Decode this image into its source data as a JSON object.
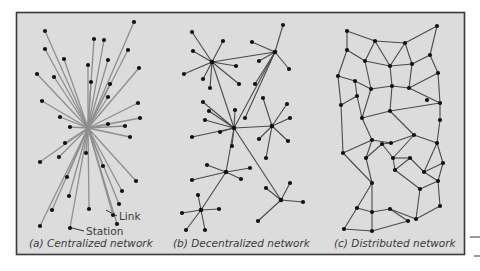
{
  "diagram": {
    "colors": {
      "background": "#ffffff",
      "panel": "#dcdcdc",
      "border": "#3a3a3a",
      "centralized_link": "#8e8e8e",
      "link": "#4a4a4a",
      "node": "#111111",
      "text": "#3a3a3a"
    },
    "panels": [
      {
        "id": "a",
        "caption": "(a) Centralized network",
        "type": "centralized",
        "annotations": [
          {
            "label": "Link",
            "x": 119,
            "y": 219
          },
          {
            "label": "Station",
            "x": 86,
            "y": 234
          }
        ]
      },
      {
        "id": "b",
        "caption": "(b) Decentralized network",
        "type": "decentralized"
      },
      {
        "id": "c",
        "caption": "(c) Distributed network",
        "type": "distributed"
      }
    ],
    "centralized": {
      "hub": [
        88,
        128
      ],
      "nodes": [
        [
          45,
          31
        ],
        [
          94,
          39
        ],
        [
          104,
          40
        ],
        [
          134,
          22
        ],
        [
          45,
          49
        ],
        [
          64,
          59
        ],
        [
          108,
          60
        ],
        [
          128,
          50
        ],
        [
          37,
          74
        ],
        [
          54,
          77
        ],
        [
          88,
          65
        ],
        [
          91,
          82
        ],
        [
          110,
          84
        ],
        [
          139,
          68
        ],
        [
          42,
          101
        ],
        [
          60,
          117
        ],
        [
          70,
          127
        ],
        [
          108,
          97
        ],
        [
          138,
          103
        ],
        [
          140,
          118
        ],
        [
          108,
          124
        ],
        [
          125,
          126
        ],
        [
          65,
          143
        ],
        [
          130,
          137
        ],
        [
          40,
          162
        ],
        [
          59,
          157
        ],
        [
          86,
          153
        ],
        [
          103,
          166
        ],
        [
          136,
          181
        ],
        [
          67,
          177
        ],
        [
          122,
          191
        ],
        [
          69,
          196
        ],
        [
          89,
          209
        ],
        [
          113,
          215
        ],
        [
          119,
          204
        ],
        [
          40,
          226
        ],
        [
          52,
          210
        ],
        [
          70,
          228
        ],
        [
          117,
          224
        ]
      ]
    },
    "decentralized": {
      "hubs": [
        [
          212,
          62
        ],
        [
          275,
          52
        ],
        [
          234,
          128
        ],
        [
          272,
          126
        ],
        [
          226,
          172
        ],
        [
          201,
          210
        ],
        [
          281,
          200
        ]
      ],
      "hub_links": [
        [
          0,
          1
        ],
        [
          0,
          2
        ],
        [
          1,
          2
        ],
        [
          2,
          3
        ],
        [
          2,
          4
        ],
        [
          2,
          6
        ],
        [
          4,
          5
        ]
      ],
      "spokes": [
        [
          0,
          [
            192,
            32
          ],
          [
            223,
            41
          ],
          [
            193,
            51
          ],
          [
            236,
            66
          ],
          [
            184,
            74
          ],
          [
            203,
            79
          ],
          [
            210,
            88
          ],
          [
            239,
            84
          ]
        ],
        [
          1,
          [
            283,
            25
          ],
          [
            252,
            42
          ],
          [
            259,
            61
          ],
          [
            289,
            69
          ],
          [
            255,
            84
          ],
          [
            245,
            118
          ]
        ],
        [
          2,
          [
            209,
            111
          ],
          [
            203,
            102
          ],
          [
            205,
            120
          ],
          [
            220,
            132
          ],
          [
            232,
            146
          ],
          [
            192,
            137
          ],
          [
            235,
            110
          ]
        ],
        [
          3,
          [
            263,
            98
          ],
          [
            287,
            104
          ],
          [
            290,
            118
          ],
          [
            259,
            139
          ],
          [
            288,
            141
          ],
          [
            266,
            158
          ]
        ],
        [
          4,
          [
            207,
            165
          ],
          [
            250,
            168
          ],
          [
            192,
            180
          ],
          [
            241,
            179
          ]
        ],
        [
          5,
          [
            186,
            230
          ],
          [
            198,
            195
          ],
          [
            219,
            209
          ],
          [
            182,
            213
          ],
          [
            205,
            230
          ]
        ],
        [
          6,
          [
            290,
            183
          ],
          [
            266,
            188
          ],
          [
            258,
            221
          ],
          [
            303,
            202
          ]
        ]
      ]
    },
    "distributed": {
      "nodes": [
        [
          347,
          31
        ],
        [
          375,
          41
        ],
        [
          405,
          43
        ],
        [
          437,
          26
        ],
        [
          347,
          50
        ],
        [
          365,
          61
        ],
        [
          390,
          66
        ],
        [
          412,
          64
        ],
        [
          430,
          55
        ],
        [
          438,
          73
        ],
        [
          338,
          76
        ],
        [
          355,
          81
        ],
        [
          371,
          89
        ],
        [
          392,
          86
        ],
        [
          409,
          88
        ],
        [
          427,
          100
        ],
        [
          357,
          96
        ],
        [
          341,
          105
        ],
        [
          362,
          118
        ],
        [
          390,
          111
        ],
        [
          440,
          103
        ],
        [
          440,
          120
        ],
        [
          372,
          140
        ],
        [
          391,
          143
        ],
        [
          414,
          135
        ],
        [
          437,
          143
        ],
        [
          343,
          153
        ],
        [
          366,
          158
        ],
        [
          382,
          144
        ],
        [
          393,
          158
        ],
        [
          395,
          170
        ],
        [
          410,
          158
        ],
        [
          424,
          172
        ],
        [
          443,
          163
        ],
        [
          372,
          183
        ],
        [
          420,
          189
        ],
        [
          438,
          181
        ],
        [
          357,
          208
        ],
        [
          372,
          212
        ],
        [
          390,
          209
        ],
        [
          416,
          219
        ],
        [
          440,
          206
        ],
        [
          344,
          229
        ],
        [
          372,
          231
        ],
        [
          408,
          221
        ]
      ],
      "edges": [
        [
          0,
          1
        ],
        [
          1,
          2
        ],
        [
          2,
          3
        ],
        [
          0,
          4
        ],
        [
          3,
          8
        ],
        [
          1,
          5
        ],
        [
          1,
          6
        ],
        [
          2,
          6
        ],
        [
          2,
          7
        ],
        [
          4,
          5
        ],
        [
          4,
          10
        ],
        [
          5,
          6
        ],
        [
          5,
          12
        ],
        [
          6,
          7
        ],
        [
          6,
          13
        ],
        [
          7,
          8
        ],
        [
          7,
          14
        ],
        [
          8,
          9
        ],
        [
          10,
          11
        ],
        [
          10,
          17
        ],
        [
          11,
          12
        ],
        [
          11,
          16
        ],
        [
          12,
          13
        ],
        [
          12,
          18
        ],
        [
          13,
          14
        ],
        [
          13,
          19
        ],
        [
          14,
          9
        ],
        [
          14,
          20
        ],
        [
          9,
          20
        ],
        [
          16,
          17
        ],
        [
          16,
          18
        ],
        [
          17,
          26
        ],
        [
          18,
          19
        ],
        [
          18,
          22
        ],
        [
          19,
          20
        ],
        [
          19,
          24
        ],
        [
          20,
          21
        ],
        [
          21,
          25
        ],
        [
          22,
          23
        ],
        [
          22,
          26
        ],
        [
          22,
          27
        ],
        [
          23,
          28
        ],
        [
          23,
          24
        ],
        [
          24,
          25
        ],
        [
          24,
          29
        ],
        [
          25,
          32
        ],
        [
          25,
          33
        ],
        [
          26,
          34
        ],
        [
          27,
          28
        ],
        [
          27,
          34
        ],
        [
          28,
          29
        ],
        [
          29,
          30
        ],
        [
          29,
          31
        ],
        [
          30,
          31
        ],
        [
          30,
          35
        ],
        [
          31,
          32
        ],
        [
          32,
          33
        ],
        [
          32,
          36
        ],
        [
          33,
          36
        ],
        [
          34,
          37
        ],
        [
          34,
          38
        ],
        [
          35,
          36
        ],
        [
          35,
          40
        ],
        [
          36,
          41
        ],
        [
          37,
          38
        ],
        [
          37,
          42
        ],
        [
          38,
          39
        ],
        [
          38,
          43
        ],
        [
          39,
          40
        ],
        [
          39,
          44
        ],
        [
          40,
          41
        ],
        [
          42,
          43
        ],
        [
          43,
          44
        ]
      ]
    }
  }
}
